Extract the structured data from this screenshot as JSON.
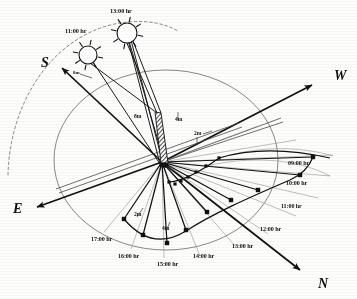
{
  "figure": {
    "type": "sun-path-shadow-diagram",
    "background_color": "#fdfdfc",
    "ink_color": "#111111",
    "thin_ink_color": "#5a5a5a"
  },
  "compass": {
    "south": {
      "label": "S",
      "x": 41,
      "y": 63,
      "arrow_angle_deg": 213
    },
    "west": {
      "label": "W",
      "x": 334,
      "y": 76,
      "arrow_angle_deg": 332
    },
    "east": {
      "label": "E",
      "x": 13,
      "y": 209,
      "arrow_angle_deg": 152
    },
    "north": {
      "label": "N",
      "x": 318,
      "y": 284,
      "arrow_angle_deg": 62
    }
  },
  "suns": [
    {
      "label": "11:00 hr",
      "cx": 88,
      "cy": 55,
      "r": 9,
      "label_x": 65,
      "label_y": 28
    },
    {
      "label": "13:00 hr",
      "cx": 127,
      "cy": 33,
      "r": 10,
      "label_x": 110,
      "label_y": 8
    }
  ],
  "hour_labels": [
    {
      "label": "09:00 hr",
      "x": 288,
      "y": 160
    },
    {
      "label": "10:00 hr",
      "x": 286,
      "y": 180
    },
    {
      "label": "11:00 hr",
      "x": 281,
      "y": 203
    },
    {
      "label": "12:00 hr",
      "x": 260,
      "y": 226
    },
    {
      "label": "13:00 hr",
      "x": 232,
      "y": 243
    },
    {
      "label": "14:00 hr",
      "x": 193,
      "y": 253
    },
    {
      "label": "15:00 hr",
      "x": 157,
      "y": 261
    },
    {
      "label": "16:00 hr",
      "x": 118,
      "y": 253
    },
    {
      "label": "17:00 hr",
      "x": 91,
      "y": 236
    }
  ],
  "dimension_labels": [
    {
      "label": "8m",
      "x": 134,
      "y": 114
    },
    {
      "label": "4m",
      "x": 175,
      "y": 117
    },
    {
      "label": "2m",
      "x": 194,
      "y": 131
    },
    {
      "label": "2m",
      "x": 134,
      "y": 212
    },
    {
      "label": "4m",
      "x": 162,
      "y": 226
    },
    {
      "label": "8m",
      "x": 73,
      "y": 70
    }
  ],
  "mast": {
    "base_x": 162,
    "base_y": 162,
    "top_x": 157,
    "top_y": 112,
    "width": 6,
    "hatched": true
  },
  "chart_data": {
    "type": "scatter",
    "title": "",
    "xlabel": "",
    "ylabel": "",
    "legend": [],
    "shadow_tips": [
      {
        "hour": "09:00 hr",
        "x": 313,
        "y": 157
      },
      {
        "hour": "10:00 hr",
        "x": 300,
        "y": 175
      },
      {
        "hour": "11:00 hr",
        "x": 258,
        "y": 190
      },
      {
        "hour": "12:00 hr",
        "x": 231,
        "y": 200
      },
      {
        "hour": "13:00 hr",
        "x": 207,
        "y": 212
      },
      {
        "hour": "14:00 hr",
        "x": 186,
        "y": 230
      },
      {
        "hour": "15:00 hr",
        "x": 167,
        "y": 243
      },
      {
        "hour": "16:00 hr",
        "x": 143,
        "y": 235
      },
      {
        "hour": "17:00 hr",
        "x": 124,
        "y": 219
      }
    ],
    "inner_tips": [
      {
        "hour": "09:00 hr",
        "x": 219,
        "y": 158
      },
      {
        "hour": "10:00 hr",
        "x": 206,
        "y": 166
      },
      {
        "hour": "11:00 hr",
        "x": 196,
        "y": 172
      },
      {
        "hour": "12:00 hr",
        "x": 188,
        "y": 177
      },
      {
        "hour": "13:00 hr",
        "x": 181,
        "y": 181
      },
      {
        "hour": "14:00 hr",
        "x": 175,
        "y": 184
      },
      {
        "hour": "15:00 hr",
        "x": 169,
        "y": 182
      }
    ],
    "horizon_ellipse": {
      "cx": 166,
      "cy": 160,
      "rx": 112,
      "ry": 90
    },
    "solar_arc": {
      "kind": "dashed",
      "description": "dashed apparent solar path arc passing through the 11:00 and 13:00 sun symbols"
    },
    "grid": false
  }
}
